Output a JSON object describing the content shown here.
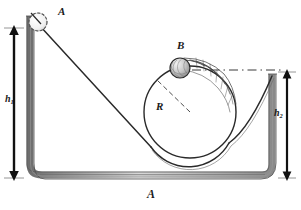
{
  "figure": {
    "title": "A",
    "domain_type": "physics-mechanics-diagram",
    "background_color": "#ffffff",
    "ink_color": "#1a1a1a"
  },
  "labels": {
    "ball_a": "A",
    "ball_b": "B",
    "radius": "R",
    "height_left": "h",
    "height_left_sub": "1",
    "height_right": "h",
    "height_right_sub": "2",
    "figure_caption": "A"
  },
  "objects": {
    "ball_a": {
      "name": "ball-a",
      "cx": 38,
      "cy": 22,
      "r": 9,
      "style": "open-outline-sphere",
      "label": "A"
    },
    "ball_b": {
      "name": "ball-b",
      "cx": 180,
      "cy": 68,
      "r": 10,
      "style": "shaded-hatched-sphere",
      "label": "B",
      "motion_trail_segments": 6
    },
    "loop": {
      "name": "circular-loop",
      "cx": 190,
      "cy": 112,
      "r": 46,
      "radius_label": "R"
    },
    "incline": {
      "name": "incline-ramp",
      "x1": 40,
      "y1": 28,
      "x2": 150,
      "y2": 148
    },
    "left_wall": {
      "x": 30,
      "y_top": 16,
      "y_bottom": 172
    },
    "right_wall": {
      "x": 272,
      "y_top": 74,
      "y_bottom": 172
    },
    "base_rail": {
      "x1": 30,
      "x2": 272,
      "y": 175
    }
  },
  "measurements": {
    "h1": {
      "name": "height-h1-arrow",
      "x": 14,
      "y_top": 28,
      "y_bottom": 178,
      "label": "h1",
      "double_headed": true
    },
    "h2": {
      "name": "height-h2-arrow",
      "x": 287,
      "y_top": 72,
      "y_bottom": 178,
      "label": "h2",
      "double_headed": true
    },
    "reference_line": {
      "name": "dash-dot-reference-line",
      "x1": 192,
      "x2": 283,
      "y": 70,
      "style": "dash-dot"
    }
  }
}
